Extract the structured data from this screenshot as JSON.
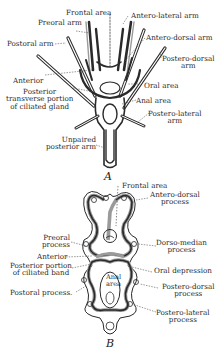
{
  "figure_a": {
    "caption": "A",
    "labels": {
      "frontal_area": "Frontal area",
      "antero_lateral_arm": "Antero-lateral arm",
      "preoral_arm": "Preoral arm",
      "postoral_arm": "Postoral arm",
      "antero_dorsal_arm": "Antero-dorsal arm",
      "postero_dorsal_arm_1": "Postero-dorsal",
      "postero_dorsal_arm_2": "arm",
      "anterior": "Anterior",
      "oral_area": "Oral area",
      "posterior_1": "Posterior",
      "posterior_2": "transverse portion",
      "posterior_3": "of ciliated gland",
      "anal_area": "Anal area",
      "postero_lateral_arm_1": "Postero-lateral",
      "postero_lateral_arm_2": "arm",
      "unpaired_1": "Unpaired",
      "unpaired_2": "posterior arm"
    }
  },
  "figure_b": {
    "caption": "B",
    "labels": {
      "frontal_area": "Frontal area",
      "antero_dorsal_1": "Antero-dorsal",
      "antero_dorsal_2": "process",
      "preoral_1": "Preoral",
      "preoral_2": "process",
      "dorso_median_1": "Dorso-median",
      "dorso_median_2": "process",
      "anterior": "Anterior",
      "posterior_portion_1": "Posterior portion",
      "posterior_portion_2": "of ciliated band",
      "oral_depression": "Oral depression",
      "postoral_process": "Postoral process.",
      "postero_dorsal_1": "Postero-dorsal",
      "postero_dorsal_2": "process",
      "anal_area_1": "Anal",
      "anal_area_2": "area",
      "postero_lateral_1": "Postero-lateral",
      "postero_lateral_2": "process"
    }
  },
  "colors": {
    "ink": "#2a2a2a",
    "shade": "#9a9a9a",
    "paper": "#ffffff"
  }
}
